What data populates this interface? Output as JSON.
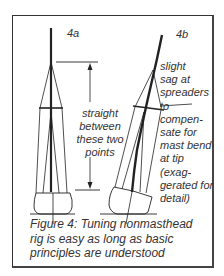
{
  "figure": {
    "panel_a": {
      "label": "4a",
      "note": "straight\nbetween\nthese two\npoints"
    },
    "panel_b": {
      "label": "4b",
      "note": "slight\nsag at\nspreaders\n     to\ncompen-\nsate for\nmast bend\nat tip\n(exag-\ngerated for\ndetail)"
    },
    "caption": "Figure 4: Tuning nonmasthead\nrig is easy as long as basic\nprinciples are understood",
    "colors": {
      "ink": "#222222",
      "text": "#333333",
      "frame": "#444444",
      "background": "#ffffff"
    }
  }
}
